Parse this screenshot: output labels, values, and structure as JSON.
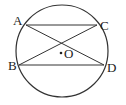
{
  "diagram": {
    "type": "circle-geometry",
    "circle": {
      "center_label": "O",
      "cx": 62,
      "cy": 51,
      "r": 46
    },
    "points": [
      {
        "label": "A",
        "x": 26,
        "y": 25
      },
      {
        "label": "C",
        "x": 97,
        "y": 25
      },
      {
        "label": "B",
        "x": 19,
        "y": 65
      },
      {
        "label": "D",
        "x": 104,
        "y": 65
      }
    ],
    "segments": [
      "AC",
      "BD",
      "AD",
      "BC"
    ],
    "labels": {
      "A": "A",
      "B": "B",
      "C": "C",
      "D": "D",
      "O": "O"
    },
    "stroke_color": "#333333"
  }
}
